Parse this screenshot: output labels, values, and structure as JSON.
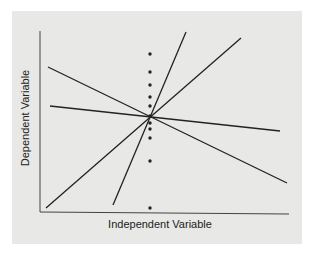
{
  "figure": {
    "xlabel": "Independent Variable",
    "ylabel": "Dependent Variable",
    "background_color": "#e8e8e6",
    "line_color": "#222222"
  },
  "chart_data": {
    "type": "scatter",
    "title": "",
    "xlabel": "Independent Variable",
    "ylabel": "Dependent Variable",
    "grid": false,
    "legend": null,
    "axes_pixels": {
      "origin": [
        40,
        212
      ],
      "y_top": [
        40,
        31
      ],
      "x_end": [
        289,
        212
      ]
    },
    "points": [
      {
        "x": 150,
        "y": 54
      },
      {
        "x": 150,
        "y": 72
      },
      {
        "x": 150,
        "y": 85
      },
      {
        "x": 150,
        "y": 97
      },
      {
        "x": 150,
        "y": 106
      },
      {
        "x": 150,
        "y": 116
      },
      {
        "x": 150,
        "y": 123
      },
      {
        "x": 150,
        "y": 129
      },
      {
        "x": 150,
        "y": 138
      },
      {
        "x": 150,
        "y": 161
      },
      {
        "x": 150,
        "y": 208
      }
    ],
    "lines": [
      {
        "name": "steep-negative",
        "x1": 48,
        "y1": 67,
        "x2": 287,
        "y2": 183
      },
      {
        "name": "shallow-negative",
        "x1": 50,
        "y1": 106,
        "x2": 280,
        "y2": 131
      },
      {
        "name": "shallow-positive",
        "x1": 46,
        "y1": 208,
        "x2": 241,
        "y2": 38
      },
      {
        "name": "steep-positive",
        "x1": 113,
        "y1": 205,
        "x2": 186,
        "y2": 32
      }
    ],
    "intersection": {
      "x": 150,
      "y": 116
    },
    "note": "All four regression lines pass through a common point; dots form a vertical column at one x value."
  }
}
